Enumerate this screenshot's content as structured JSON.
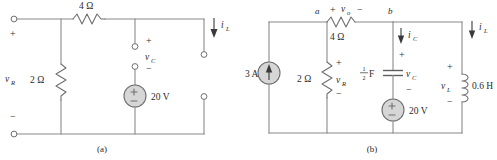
{
  "figure": {
    "background_color": "#ffffff",
    "wire_color": "#8a8a8a",
    "component_color": "#6f6f6f",
    "source_fill_color": "#d6d6d6",
    "text_color": "#2b2b2b"
  },
  "circuit_a": {
    "caption": "(a)",
    "left_terminal_plus": "+",
    "left_terminal_minus": "−",
    "left_terminal_voltage": "v",
    "left_terminal_voltage_sub": "R",
    "series_resistor_label": "4 Ω",
    "shunt_resistor_label": "2 Ω",
    "cap_terminal_plus": "+",
    "cap_terminal_minus": "−",
    "cap_terminal_voltage": "v",
    "cap_terminal_voltage_sub": "C",
    "voltage_source_label": "20 V",
    "voltage_source_plus": "+",
    "voltage_source_minus": "−",
    "inductor_current_label": "i",
    "inductor_current_sub": "L"
  },
  "circuit_b": {
    "caption": "(b)",
    "current_source_label": "3 A",
    "node_a_label": "a",
    "node_b_label": "b",
    "series_resistor_label": "4 Ω",
    "series_resistor_voltage": "v",
    "series_resistor_voltage_sub": "o",
    "series_resistor_plus": "+",
    "series_resistor_minus": "−",
    "shunt_resistor_label": "2 Ω",
    "shunt_resistor_voltage": "v",
    "shunt_resistor_voltage_sub": "R",
    "shunt_resistor_plus": "+",
    "shunt_resistor_minus": "−",
    "capacitor_label_num": "1",
    "capacitor_label_den": "2",
    "capacitor_label_unit": "F",
    "capacitor_voltage": "v",
    "capacitor_voltage_sub": "C",
    "capacitor_plus": "+",
    "capacitor_minus": "−",
    "capacitor_current": "i",
    "capacitor_current_sub": "C",
    "voltage_source_label": "20 V",
    "voltage_source_plus": "+",
    "voltage_source_minus": "−",
    "inductor_label": "0.6 H",
    "inductor_voltage": "v",
    "inductor_voltage_sub": "L",
    "inductor_plus": "+",
    "inductor_minus": "−",
    "inductor_current_label": "i",
    "inductor_current_sub": "L"
  }
}
